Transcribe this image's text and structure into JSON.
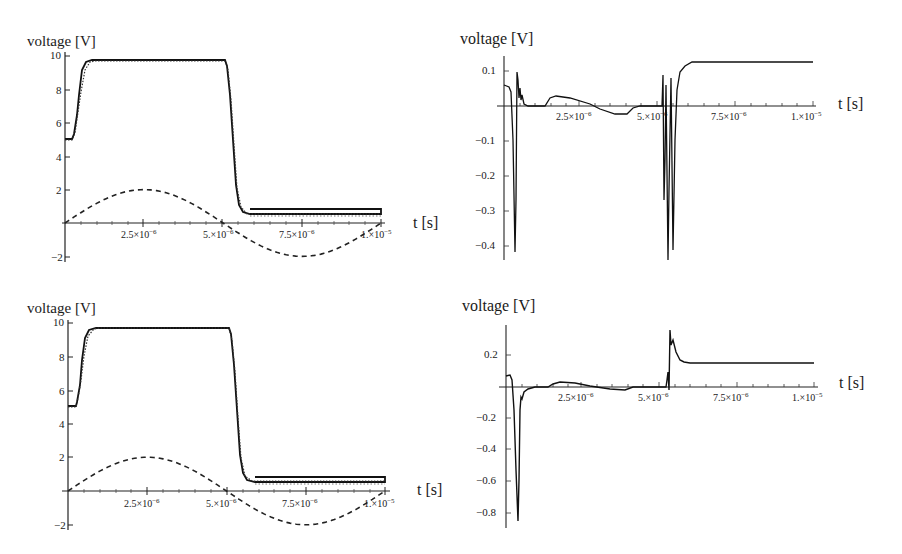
{
  "chart_data": [
    {
      "id": "top-left",
      "type": "line",
      "ylabel": "voltage [V]",
      "xlabel": "t [s]",
      "x_ticks": [
        "2.5×10⁻⁶",
        "5.×10⁻⁶",
        "7.5×10⁻⁶",
        "1.×10⁻⁵"
      ],
      "y_ticks": [
        "-2",
        "2",
        "4",
        "6",
        "8",
        "10"
      ],
      "xlim": [
        0,
        1e-05
      ],
      "ylim": [
        -2,
        10
      ],
      "series": [
        {
          "name": "output (solid)",
          "style": "solid",
          "x": [
            0,
            2e-07,
            3e-07,
            5e-07,
            7e-07,
            1e-06,
            2.5e-06,
            5e-06,
            5.1e-06,
            5.3e-06,
            5.6e-06,
            6e-06,
            7.5e-06,
            1e-05
          ],
          "y": [
            5.0,
            5.0,
            5.2,
            8.0,
            9.4,
            9.7,
            9.7,
            9.7,
            9.3,
            5.5,
            1.5,
            0.5,
            0.5,
            0.5
          ]
        },
        {
          "name": "reference (dotted)",
          "style": "dotted",
          "x": [
            0,
            2e-07,
            3e-07,
            5e-07,
            7e-07,
            1e-06,
            2.5e-06,
            5e-06,
            5.1e-06,
            5.3e-06,
            5.6e-06,
            6e-06,
            7.5e-06,
            1e-05
          ],
          "y": [
            5.0,
            5.0,
            5.3,
            8.1,
            9.4,
            9.7,
            9.7,
            9.7,
            9.2,
            5.4,
            1.4,
            0.4,
            0.4,
            0.4
          ]
        },
        {
          "name": "input (dashed sine)",
          "style": "dashed",
          "x": [
            0,
            1.25e-06,
            2.5e-06,
            3.75e-06,
            5e-06,
            6.25e-06,
            7.5e-06,
            8.75e-06,
            1e-05
          ],
          "y": [
            0,
            1.41,
            2.0,
            1.41,
            0,
            -1.41,
            -2.0,
            -1.41,
            0
          ]
        }
      ]
    },
    {
      "id": "top-right",
      "type": "line",
      "ylabel": "voltage [V]",
      "xlabel": "t [s]",
      "x_ticks": [
        "2.5×10⁻⁶",
        "5.×10⁻⁶",
        "7.5×10⁻⁶",
        "1.×10⁻⁵"
      ],
      "y_ticks": [
        "0.1",
        "-0.1",
        "-0.2",
        "-0.3",
        "-0.4"
      ],
      "xlim": [
        0,
        1e-05
      ],
      "ylim": [
        -0.43,
        0.13
      ],
      "series": [
        {
          "name": "difference",
          "style": "solid",
          "x": [
            0,
            2e-07,
            3e-07,
            3.5e-07,
            4.5e-07,
            5e-07,
            8e-07,
            1.3e-06,
            1.6e-06,
            2.5e-06,
            4.5e-06,
            4.8e-06,
            5e-06,
            5.05e-06,
            5.1e-06,
            5.2e-06,
            5.3e-06,
            5.4e-06,
            5.6e-06,
            6e-06,
            1e-05
          ],
          "y": [
            0.06,
            0.05,
            -0.42,
            0.1,
            0.02,
            0.0,
            0.0,
            0.0,
            0.03,
            0.01,
            -0.025,
            0.0,
            0.0,
            0.11,
            -0.32,
            0.09,
            -0.3,
            0.0,
            0.1,
            0.13,
            0.13
          ]
        }
      ]
    },
    {
      "id": "bottom-left",
      "type": "line",
      "ylabel": "voltage [V]",
      "xlabel": "t [s]",
      "x_ticks": [
        "2.5×10⁻⁶",
        "5.×10⁻⁶",
        "7.5×10⁻⁶",
        "1.×10⁻⁵"
      ],
      "y_ticks": [
        "-2",
        "2",
        "4",
        "6",
        "8",
        "10"
      ],
      "xlim": [
        0,
        1e-05
      ],
      "ylim": [
        -2,
        10
      ],
      "series": [
        {
          "name": "output (solid)",
          "style": "solid",
          "x": [
            0,
            2e-07,
            3e-07,
            5e-07,
            7e-07,
            1e-06,
            2.5e-06,
            5e-06,
            5.1e-06,
            5.3e-06,
            5.6e-06,
            6e-06,
            7.5e-06,
            1e-05
          ],
          "y": [
            5.0,
            5.0,
            5.2,
            8.0,
            9.4,
            9.7,
            9.7,
            9.7,
            9.3,
            5.5,
            1.5,
            0.5,
            0.5,
            0.5
          ]
        },
        {
          "name": "reference (dotted)",
          "style": "dotted",
          "x": [
            0,
            2e-07,
            3e-07,
            5e-07,
            7e-07,
            1e-06,
            2.5e-06,
            5e-06,
            5.1e-06,
            5.3e-06,
            5.6e-06,
            6e-06,
            7.5e-06,
            1e-05
          ],
          "y": [
            5.0,
            5.0,
            5.4,
            8.1,
            9.4,
            9.7,
            9.7,
            9.7,
            9.2,
            5.4,
            1.4,
            0.4,
            0.4,
            0.4
          ]
        },
        {
          "name": "input (dashed sine)",
          "style": "dashed",
          "x": [
            0,
            1.25e-06,
            2.5e-06,
            3.75e-06,
            5e-06,
            6.25e-06,
            7.5e-06,
            8.75e-06,
            1e-05
          ],
          "y": [
            0,
            1.41,
            2.0,
            1.41,
            0,
            -1.41,
            -2.0,
            -1.41,
            0
          ]
        }
      ]
    },
    {
      "id": "bottom-right",
      "type": "line",
      "ylabel": "voltage [V]",
      "xlabel": "t [s]",
      "x_ticks": [
        "2.5×10⁻⁶",
        "5.×10⁻⁶",
        "7.5×10⁻⁶",
        "1.×10⁻⁵"
      ],
      "y_ticks": [
        "0.2",
        "-0.2",
        "-0.4",
        "-0.6",
        "-0.8"
      ],
      "xlim": [
        0,
        1e-05
      ],
      "ylim": [
        -0.85,
        0.36
      ],
      "series": [
        {
          "name": "difference",
          "style": "solid",
          "x": [
            0,
            1e-07,
            2e-07,
            3.5e-07,
            4.5e-07,
            6e-07,
            8e-07,
            1e-06,
            1.6e-06,
            2e-06,
            2.5e-06,
            4.5e-06,
            4.8e-06,
            5e-06,
            5.05e-06,
            5.1e-06,
            5.2e-06,
            5.4e-06,
            5.6e-06,
            1e-05
          ],
          "y": [
            0.07,
            0.07,
            0.0,
            -0.85,
            -0.05,
            -0.02,
            0.0,
            0.0,
            0.03,
            0.02,
            0.01,
            -0.02,
            0.0,
            0.0,
            0.1,
            0.36,
            0.28,
            0.17,
            0.14,
            0.15
          ]
        }
      ]
    }
  ],
  "panels": {
    "tl": {
      "ylabel": "voltage [V]",
      "xlabel": "t [s]",
      "xt1": "2.5×10",
      "xt2": "5.×10",
      "xt3": "7.5×10",
      "xt4": "1.×10",
      "e6": "−6",
      "e5": "−5",
      "y": [
        "−2",
        "2",
        "4",
        "6",
        "8",
        "10"
      ]
    },
    "tr": {
      "ylabel": "voltage [V]",
      "xlabel": "t [s]",
      "xt1": "2.5×10",
      "xt2": "5.×10",
      "xt3": "7.5×10",
      "xt4": "1.×10",
      "e6": "−6",
      "e5": "−5",
      "y": [
        "0.1",
        "−0.1",
        "−0.2",
        "−0.3",
        "−0.4"
      ]
    },
    "bl": {
      "ylabel": "voltage [V]",
      "xlabel": "t [s]",
      "xt1": "2.5×10",
      "xt2": "5.×10",
      "xt3": "7.5×10",
      "xt4": "1.×10",
      "e6": "−6",
      "e5": "−5",
      "y": [
        "−2",
        "2",
        "4",
        "6",
        "8",
        "10"
      ]
    },
    "br": {
      "ylabel": "voltage [V]",
      "xlabel": "t [s]",
      "xt1": "2.5×10",
      "xt2": "5.×10",
      "xt3": "7.5×10",
      "xt4": "1.×10",
      "e6": "−6",
      "e5": "−5",
      "y": [
        "0.2",
        "−0.2",
        "−0.4",
        "−0.6",
        "−0.8"
      ]
    }
  }
}
